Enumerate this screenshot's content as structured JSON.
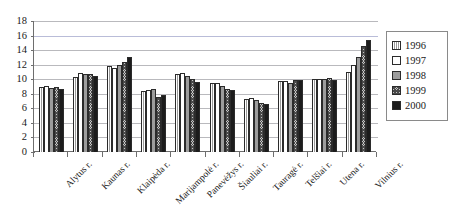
{
  "chart_data": {
    "type": "bar",
    "title": "",
    "subtitle": "",
    "xlabel": "",
    "ylabel": "",
    "ylim": [
      0,
      18
    ],
    "ytick_step": 2,
    "yticks": [
      18,
      16,
      14,
      12,
      10,
      8,
      6,
      4,
      2,
      0
    ],
    "grid": true,
    "grid_axis": "y",
    "legend_position": "right",
    "categories": [
      "Alytus r.",
      "Kaunas r.",
      "Klaipėda r.",
      "Marijampolė r.",
      "Panevėžys r.",
      "Šiauliai r.",
      "Tauragė r.",
      "Telšiai r.",
      "Utena r.",
      "Vilnius r."
    ],
    "series": [
      {
        "name": "1996",
        "values": [
          9.0,
          10.3,
          11.8,
          8.4,
          10.7,
          9.5,
          7.3,
          9.8,
          10.0,
          11.0
        ]
      },
      {
        "name": "1997",
        "values": [
          9.1,
          10.8,
          11.6,
          8.5,
          10.8,
          9.5,
          7.4,
          9.8,
          10.0,
          11.9
        ]
      },
      {
        "name": "1998",
        "values": [
          8.8,
          10.7,
          11.9,
          8.6,
          10.5,
          9.1,
          7.1,
          9.5,
          10.1,
          13.0
        ]
      },
      {
        "name": "1999",
        "values": [
          9.0,
          10.7,
          12.4,
          7.5,
          10.1,
          8.7,
          6.7,
          9.9,
          10.2,
          14.6
        ]
      },
      {
        "name": "2000",
        "values": [
          8.7,
          10.5,
          13.0,
          7.9,
          9.6,
          8.5,
          6.6,
          9.9,
          9.9,
          15.4
        ]
      }
    ],
    "legend": [
      "1996",
      "1997",
      "1998",
      "1999",
      "2000"
    ],
    "series_styles": [
      "light-vertical-hatch",
      "white",
      "gray",
      "crosshatch",
      "black"
    ]
  }
}
